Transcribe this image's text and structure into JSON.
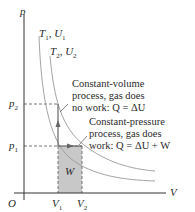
{
  "diagram": {
    "axes": {
      "y_label": "p",
      "x_label": "V",
      "origin_label": "O",
      "y_ticks": [
        {
          "label": "p",
          "sub": "2"
        },
        {
          "label": "p",
          "sub": "1"
        }
      ],
      "x_ticks": [
        {
          "label": "V",
          "sub": "1"
        },
        {
          "label": "V",
          "sub": "2"
        }
      ]
    },
    "isotherms": [
      {
        "label_main": "T",
        "label_sub": "1",
        "label_u": "U",
        "label_u_sub": "1"
      },
      {
        "label_main": "T",
        "label_sub": "2",
        "label_u": "U",
        "label_u_sub": "2"
      }
    ],
    "work_area_label": "W",
    "annotations": {
      "constant_volume": {
        "line1": "Constant-volume",
        "line2": "process, gas does",
        "line3": "no work: Q = ΔU"
      },
      "constant_pressure": {
        "line1": "Constant-pressure",
        "line2": "process, gas does",
        "line3": "work: Q = ΔU + W"
      }
    },
    "colors": {
      "axis": "#333333",
      "curve": "#9a9a9a",
      "shade": "#c8c8c8",
      "dash": "#555555",
      "arrow": "#666666"
    }
  }
}
